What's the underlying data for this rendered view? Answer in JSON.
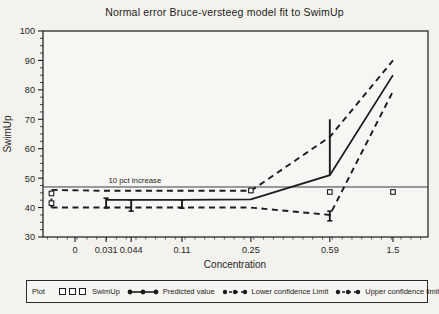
{
  "window": {
    "background": "#f3f2ed",
    "ink": "#1c1c1c"
  },
  "chart_data": {
    "type": "line",
    "title": "Normal error Bruce-versteeg model fit to SwimUp",
    "xlabel": "Concentration",
    "ylabel": "SwimUp",
    "ylim": [
      30,
      100
    ],
    "grid": false,
    "y_major_ticks": [
      100,
      90,
      80,
      70,
      60,
      50,
      40,
      30
    ],
    "x_tick_labels": [
      "0",
      "0.031",
      "0.044",
      "0.11",
      "0.25",
      "0.59",
      "1.5"
    ],
    "x_tick_fracs": [
      0.083,
      0.164,
      0.229,
      0.361,
      0.54,
      0.745,
      0.909
    ],
    "reference_line": {
      "value": 47,
      "label": "10 pct increase"
    },
    "series": [
      {
        "name": "Predicted value",
        "style": "solid",
        "x": [
          0.031,
          0.044,
          0.11,
          0.25,
          0.59,
          1.5
        ],
        "x_fracs": [
          0.164,
          0.229,
          0.361,
          0.54,
          0.745,
          0.909
        ],
        "values": [
          42.6,
          42.6,
          42.6,
          42.8,
          51,
          85
        ]
      },
      {
        "name": "Upper confidence limit",
        "style": "dashed",
        "x": [
          0,
          0.031,
          0.044,
          0.11,
          0.25,
          0.59,
          1.5
        ],
        "x_fracs": [
          0.022,
          0.164,
          0.229,
          0.361,
          0.54,
          0.745,
          0.909
        ],
        "values": [
          46,
          45.7,
          45.7,
          45.7,
          45.7,
          64,
          90
        ]
      },
      {
        "name": "Lower confidence Limit",
        "style": "dashed",
        "x": [
          0,
          0.031,
          0.044,
          0.11,
          0.25,
          0.59,
          1.5
        ],
        "x_fracs": [
          0.022,
          0.164,
          0.229,
          0.361,
          0.54,
          0.745,
          0.909
        ],
        "values": [
          40,
          40,
          40,
          40,
          40,
          37.5,
          79.5
        ]
      }
    ],
    "observations": {
      "name": "SwimUp",
      "marker": "open-square",
      "points": [
        {
          "x": 0,
          "y": 44.8,
          "x_frac": 0.022
        },
        {
          "x": 0,
          "y": 41.5,
          "x_frac": 0.022
        },
        {
          "x": 0.25,
          "y": 45.8,
          "x_frac": 0.54
        },
        {
          "x": 0.59,
          "y": 45.3,
          "x_frac": 0.745
        },
        {
          "x": 1.5,
          "y": 45.3,
          "x_frac": 0.909
        }
      ]
    },
    "error_bars": [
      {
        "x": 0,
        "x_frac": 0.022,
        "from": 40,
        "to": 46,
        "style": "dashed"
      },
      {
        "x": 0.031,
        "x_frac": 0.164,
        "from": 39.9,
        "to": 43.2,
        "style": "solid",
        "caps": true
      },
      {
        "x": 0.044,
        "x_frac": 0.229,
        "from": 38.8,
        "to": 42.6,
        "style": "solid",
        "caps": true
      },
      {
        "x": 0.11,
        "x_frac": 0.361,
        "from": 39.8,
        "to": 42.6,
        "style": "solid",
        "caps": true
      },
      {
        "x": 0.59,
        "x_frac": 0.745,
        "from": 51,
        "to": 70,
        "style": "solid",
        "caps": false
      },
      {
        "x": 0.59,
        "x_frac": 0.745,
        "from": 35.5,
        "to": 38.8,
        "style": "solid",
        "caps": true
      }
    ]
  },
  "legend": {
    "plot_label": "Plot",
    "items": [
      {
        "label": "SwimUp",
        "marker": "open-squares"
      },
      {
        "label": "Predicted value",
        "marker": "solid-line-filled-circles"
      },
      {
        "label": "Lower confidence Limit",
        "marker": "dashed-line-filled-circles"
      },
      {
        "label": "Upper confidence limit",
        "marker": "dashed-line-filled-circles"
      }
    ]
  }
}
